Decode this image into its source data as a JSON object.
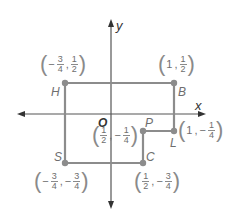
{
  "diagram": {
    "axes": {
      "x_label": "x",
      "y_label": "y",
      "origin_label": "O"
    },
    "colors": {
      "line": "#8c8c8c",
      "point": "#8c8c8c",
      "axis": "#555555",
      "text": "#6e6e6e"
    },
    "points": [
      {
        "name": "H",
        "coords_text": "(-3/4, 1/2)",
        "x_num": {
          "sign": "−",
          "num": "3",
          "den": "4"
        },
        "y_num": {
          "sign": "",
          "num": "1",
          "den": "2"
        }
      },
      {
        "name": "B",
        "coords_text": "(1, 1/2)",
        "x_plain": "1",
        "y_num": {
          "sign": "",
          "num": "1",
          "den": "2"
        }
      },
      {
        "name": "L",
        "coords_text": "(1, -1/4)",
        "x_plain": "1",
        "y_num": {
          "sign": "−",
          "num": "1",
          "den": "4"
        }
      },
      {
        "name": "P",
        "coords_text": "(1/2, -1/4)",
        "x_num": {
          "sign": "",
          "num": "1",
          "den": "2"
        },
        "y_num": {
          "sign": "−",
          "num": "1",
          "den": "4"
        }
      },
      {
        "name": "C",
        "coords_text": "(1/2, -3/4)",
        "x_num": {
          "sign": "",
          "num": "1",
          "den": "2"
        },
        "y_num": {
          "sign": "−",
          "num": "3",
          "den": "4"
        }
      },
      {
        "name": "S",
        "coords_text": "(-3/4, -3/4)",
        "x_num": {
          "sign": "−",
          "num": "3",
          "den": "4"
        },
        "y_num": {
          "sign": "−",
          "num": "3",
          "den": "4"
        }
      }
    ],
    "polygon_order": [
      "H",
      "B",
      "L",
      "P",
      "C",
      "S"
    ]
  }
}
